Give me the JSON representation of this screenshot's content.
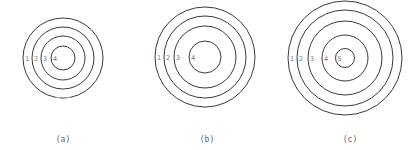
{
  "figures": [
    {
      "id": "a",
      "caption": "(a)",
      "center": [
        63,
        58
      ],
      "radii": [
        40,
        31,
        22,
        12
      ],
      "labels": [
        "1",
        "2",
        "3",
        "4"
      ],
      "caption_pos": [
        63,
        142
      ]
    },
    {
      "id": "b",
      "caption": "(b)",
      "center": [
        205,
        57
      ],
      "radii": [
        50,
        41,
        31,
        16
      ],
      "labels": [
        "1",
        "2",
        "3",
        "4"
      ],
      "caption_pos": [
        207,
        142
      ]
    },
    {
      "id": "c",
      "caption": "(c)",
      "center": [
        345,
        58
      ],
      "radii": [
        57,
        48,
        37,
        23,
        9.5
      ],
      "labels": [
        "1",
        "2",
        "3",
        "4",
        "5"
      ],
      "caption_pos": [
        350,
        142
      ]
    }
  ],
  "accent_mark": {
    "color": "#6fcf6f"
  }
}
